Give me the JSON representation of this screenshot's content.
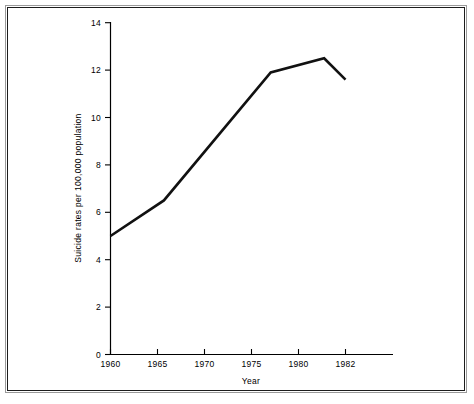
{
  "chart_data": {
    "type": "line",
    "title": "",
    "subtitle": "",
    "xlabel": "Year",
    "ylabel": "Suicide rates per 100,000 population",
    "x": [
      1960,
      1965,
      1975,
      1980,
      1982
    ],
    "values": [
      5.0,
      6.5,
      11.9,
      12.5,
      11.6
    ],
    "series": [
      {
        "name": "Suicide rate",
        "x": [
          1960,
          1965,
          1975,
          1980,
          1982
        ],
        "values": [
          5.0,
          6.5,
          11.9,
          12.5,
          11.6
        ]
      }
    ],
    "xtick_labels": [
      "1960",
      "1965",
      "1970",
      "1975",
      "1980",
      "1982"
    ],
    "xtick_values": [
      1960,
      1965,
      1970,
      1975,
      1980,
      1982
    ],
    "ytick_labels": [
      "0",
      "2",
      "4",
      "6",
      "8",
      "10",
      "12",
      "14"
    ],
    "ytick_values": [
      0,
      2,
      4,
      6,
      8,
      10,
      12,
      14
    ],
    "xlim": [
      1960,
      1985
    ],
    "ylim": [
      0,
      14
    ],
    "grid": false,
    "legend": false,
    "legend_position": "none",
    "line_color": "#111111",
    "axis_color": "#000000",
    "background_color": "#ffffff",
    "annotations": []
  },
  "axes": {
    "x_title": "Year",
    "y_title": "Suicide rates per 100,000 population"
  },
  "ticks": {
    "x": [
      {
        "label": "1960"
      },
      {
        "label": "1965"
      },
      {
        "label": "1970"
      },
      {
        "label": "1975"
      },
      {
        "label": "1980"
      },
      {
        "label": "1982"
      }
    ],
    "y": [
      {
        "label": "0"
      },
      {
        "label": "2"
      },
      {
        "label": "4"
      },
      {
        "label": "6"
      },
      {
        "label": "8"
      },
      {
        "label": "10"
      },
      {
        "label": "12"
      },
      {
        "label": "14"
      }
    ]
  }
}
